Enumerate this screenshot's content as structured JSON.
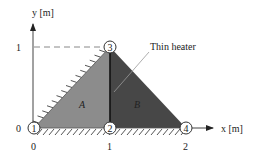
{
  "axes": {
    "x_label": "x [m]",
    "y_label": "y [m]",
    "x_ticks": [
      "0",
      "1",
      "2"
    ],
    "y_ticks": [
      "0",
      "1"
    ]
  },
  "regions": [
    {
      "id": "A",
      "label": "A",
      "color": "#8c8c8c"
    },
    {
      "id": "B",
      "label": "B",
      "color": "#474747"
    }
  ],
  "nodes": [
    {
      "id": "1",
      "label": "1",
      "x_m": 0,
      "y_m": 0
    },
    {
      "id": "2",
      "label": "2",
      "x_m": 1,
      "y_m": 0
    },
    {
      "id": "3",
      "label": "3",
      "x_m": 1,
      "y_m": 1
    },
    {
      "id": "4",
      "label": "4",
      "x_m": 2,
      "y_m": 0
    }
  ],
  "annotations": {
    "heater_label": "Thin heater"
  },
  "boundaries": {
    "insulated_edges": [
      "1-3",
      "1-4"
    ]
  }
}
